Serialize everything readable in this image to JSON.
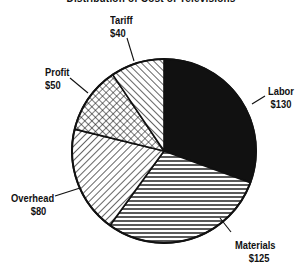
{
  "chart_data": {
    "type": "pie",
    "title": "Distribution of Cost of Televisions",
    "title_note": "cropped at top edge; only bottom of letters visible — text inferred, not read",
    "categories": [
      "Labor",
      "Materials",
      "Overhead",
      "Profit",
      "Tariff"
    ],
    "values": [
      130,
      125,
      80,
      50,
      40
    ],
    "value_labels": [
      "$130",
      "$125",
      "$80",
      "$50",
      "$40"
    ],
    "units": "$",
    "start_angle": "12 o'clock",
    "direction": "clockwise",
    "fills": {
      "Labor": "solid black",
      "Materials": "horizontal lines",
      "Overhead": "diagonal lines (\\)",
      "Profit": "crosshatch",
      "Tariff": "diagonal lines (/)"
    },
    "legend": "none (callout labels with leader lines)"
  },
  "labels": {
    "labor": {
      "name": "Labor",
      "value": "$130"
    },
    "materials": {
      "name": "Materials",
      "value": "$125"
    },
    "overhead": {
      "name": "Overhead",
      "value": "$80"
    },
    "profit": {
      "name": "Profit",
      "value": "$50"
    },
    "tariff": {
      "name": "Tariff",
      "value": "$40"
    }
  },
  "colors": {
    "ink": "#111111",
    "background": "#ffffff"
  }
}
